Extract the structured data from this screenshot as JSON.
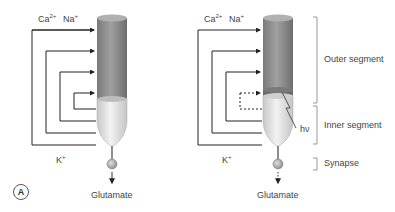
{
  "left_panel": {
    "ions_top": {
      "ca": "Ca",
      "ca_sup": "2+",
      "na": "Na",
      "na_sup": "+"
    },
    "ion_bottom": {
      "k": "K",
      "k_sup": "+"
    },
    "output": "Glutamate",
    "panel_label": "A",
    "state": "dark"
  },
  "right_panel": {
    "ions_top": {
      "ca": "Ca",
      "ca_sup": "2+",
      "na": "Na",
      "na_sup": "+"
    },
    "ion_bottom": {
      "k": "K",
      "k_sup": "+"
    },
    "output": "Glutamate",
    "light_label": "hν",
    "state": "light"
  },
  "segments": {
    "outer": "Outer segment",
    "inner": "Inner segment",
    "synapse": "Synapse"
  },
  "colors": {
    "outer_segment": "#8a8a8a",
    "inner_segment": "#dcdcdc",
    "lines": "#222222",
    "brackets": "#999999"
  }
}
